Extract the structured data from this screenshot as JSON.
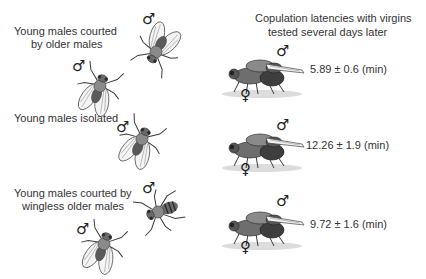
{
  "header": {
    "title_line1": "Copulation latencies with virgins",
    "title_line2": "tested several days later"
  },
  "conditions": [
    {
      "label_line1": "Young males courted",
      "label_line2": "by older males",
      "latency": "5.89 ± 0.6 (min)",
      "latency_value": 5.89,
      "latency_error": 0.6
    },
    {
      "label_line1": "Young males isolated",
      "label_line2": "",
      "latency": "12.26 ± 1.9 (min)",
      "latency_value": 12.26,
      "latency_error": 1.9
    },
    {
      "label_line1": "Young males courted by",
      "label_line2": "wingless older males",
      "latency": "9.72 ± 1.6 (min)",
      "latency_value": 9.72,
      "latency_error": 1.6
    }
  ],
  "symbols": {
    "male": "♂",
    "female": "♀"
  },
  "colors": {
    "text": "#333333",
    "fly_body": "#7a7a7a",
    "fly_dark": "#3a3a3a",
    "shadow": "#d8d8d8"
  }
}
